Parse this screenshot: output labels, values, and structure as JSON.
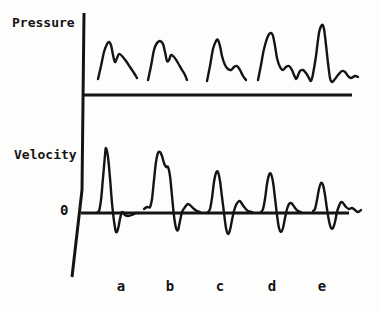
{
  "figure": {
    "background": "#fdfdfb",
    "ink": "#141414",
    "pressure_label": "Pressure",
    "velocity_label": "Velocity",
    "zero_label": "0",
    "beat_labels": [
      "a",
      "b",
      "c",
      "d",
      "e"
    ]
  },
  "chart_data": {
    "type": "line",
    "title": "",
    "xlabel": "",
    "categories": [
      "a",
      "b",
      "c",
      "d",
      "e"
    ],
    "coordinate_space": "figure pixels, y increases downward, canvas 380x311",
    "vertical_axis": {
      "points": [
        [
          84,
          13
        ],
        [
          82,
          190
        ],
        [
          72,
          277
        ]
      ],
      "width": 3
    },
    "panels": [
      {
        "name": "pressure",
        "ylabel": "Pressure",
        "baseline": {
          "y": 95,
          "x1": 82,
          "x2": 352,
          "width": 3
        },
        "series": [
          {
            "name": "a",
            "points": [
              [
                98,
                79
              ],
              [
                101,
                66
              ],
              [
                104,
                52
              ],
              [
                107,
                44
              ],
              [
                109,
                42
              ],
              [
                111,
                45
              ],
              [
                113,
                55
              ],
              [
                115,
                62
              ],
              [
                117,
                58
              ],
              [
                119,
                54
              ],
              [
                122,
                56
              ],
              [
                126,
                61
              ],
              [
                130,
                67
              ],
              [
                134,
                73
              ],
              [
                137,
                78
              ]
            ]
          },
          {
            "name": "b",
            "points": [
              [
                148,
                80
              ],
              [
                151,
                66
              ],
              [
                154,
                50
              ],
              [
                157,
                43
              ],
              [
                160,
                41
              ],
              [
                163,
                44
              ],
              [
                165,
                52
              ],
              [
                167,
                61
              ],
              [
                169,
                60
              ],
              [
                171,
                55
              ],
              [
                174,
                57
              ],
              [
                178,
                63
              ],
              [
                182,
                70
              ],
              [
                185,
                75
              ],
              [
                187,
                80
              ]
            ]
          },
          {
            "name": "c",
            "points": [
              [
                207,
                81
              ],
              [
                210,
                66
              ],
              [
                213,
                49
              ],
              [
                216,
                41
              ],
              [
                218,
                40
              ],
              [
                220,
                46
              ],
              [
                222,
                56
              ],
              [
                225,
                65
              ],
              [
                228,
                69
              ],
              [
                231,
                70
              ],
              [
                234,
                67
              ],
              [
                237,
                66
              ],
              [
                240,
                70
              ],
              [
                243,
                76
              ],
              [
                246,
                80
              ]
            ]
          },
          {
            "name": "d",
            "points": [
              [
                258,
                80
              ],
              [
                261,
                65
              ],
              [
                264,
                49
              ],
              [
                268,
                36
              ],
              [
                271,
                33
              ],
              [
                273,
                36
              ],
              [
                275,
                46
              ],
              [
                277,
                58
              ],
              [
                280,
                67
              ],
              [
                283,
                70
              ],
              [
                286,
                67
              ],
              [
                289,
                66
              ],
              [
                292,
                70
              ],
              [
                294,
                75
              ],
              [
                296,
                79
              ]
            ]
          },
          {
            "name": "e",
            "points": [
              [
                297,
                78
              ],
              [
                300,
                71
              ],
              [
                303,
                70
              ],
              [
                306,
                73
              ],
              [
                309,
                78
              ],
              [
                311,
                81
              ],
              [
                313,
                74
              ],
              [
                316,
                56
              ],
              [
                319,
                33
              ],
              [
                322,
                25
              ],
              [
                324,
                29
              ],
              [
                326,
                45
              ],
              [
                328,
                63
              ],
              [
                330,
                78
              ],
              [
                332,
                82
              ],
              [
                335,
                79
              ],
              [
                338,
                75
              ],
              [
                342,
                71
              ],
              [
                345,
                72
              ],
              [
                348,
                76
              ],
              [
                351,
                78
              ],
              [
                355,
                76
              ],
              [
                358,
                77
              ]
            ]
          }
        ]
      },
      {
        "name": "velocity",
        "ylabel": "Velocity",
        "zero_tick_label": "0",
        "baseline": {
          "y": 213,
          "x1": 81,
          "x2": 349,
          "width": 2.8
        },
        "series": [
          {
            "name": "a",
            "points": [
              [
                96,
                213
              ],
              [
                99,
                211
              ],
              [
                101,
                200
              ],
              [
                103,
                178
              ],
              [
                105,
                155
              ],
              [
                106,
                148
              ],
              [
                108,
                157
              ],
              [
                110,
                178
              ],
              [
                112,
                203
              ],
              [
                114,
                221
              ],
              [
                116,
                232
              ],
              [
                118,
                229
              ],
              [
                120,
                219
              ],
              [
                122,
                212
              ],
              [
                125,
                215
              ],
              [
                128,
                216
              ],
              [
                132,
                215
              ],
              [
                136,
                213
              ],
              [
                139,
                213
              ]
            ]
          },
          {
            "name": "b",
            "points": [
              [
                144,
                209
              ],
              [
                147,
                207
              ],
              [
                150,
                207
              ],
              [
                152,
                199
              ],
              [
                154,
                180
              ],
              [
                156,
                162
              ],
              [
                158,
                153
              ],
              [
                160,
                152
              ],
              [
                162,
                156
              ],
              [
                164,
                163
              ],
              [
                166,
                167
              ],
              [
                168,
                167
              ],
              [
                170,
                176
              ],
              [
                172,
                196
              ],
              [
                174,
                216
              ],
              [
                176,
                228
              ],
              [
                178,
                230
              ],
              [
                180,
                221
              ],
              [
                182,
                212
              ],
              [
                185,
                207
              ],
              [
                188,
                204
              ],
              [
                191,
                206
              ],
              [
                194,
                209
              ],
              [
                197,
                211
              ],
              [
                200,
                212
              ]
            ]
          },
          {
            "name": "c",
            "points": [
              [
                208,
                212
              ],
              [
                210,
                209
              ],
              [
                212,
                198
              ],
              [
                214,
                182
              ],
              [
                216,
                173
              ],
              [
                218,
                172
              ],
              [
                220,
                181
              ],
              [
                222,
                197
              ],
              [
                224,
                213
              ],
              [
                226,
                228
              ],
              [
                228,
                234
              ],
              [
                230,
                230
              ],
              [
                232,
                220
              ],
              [
                234,
                211
              ],
              [
                236,
                205
              ],
              [
                238,
                202
              ],
              [
                240,
                201
              ],
              [
                242,
                204
              ],
              [
                245,
                208
              ],
              [
                248,
                211
              ],
              [
                252,
                212
              ]
            ]
          },
          {
            "name": "d",
            "points": [
              [
                261,
                212
              ],
              [
                263,
                209
              ],
              [
                265,
                199
              ],
              [
                267,
                184
              ],
              [
                269,
                175
              ],
              [
                271,
                174
              ],
              [
                273,
                182
              ],
              [
                275,
                198
              ],
              [
                277,
                215
              ],
              [
                279,
                228
              ],
              [
                281,
                232
              ],
              [
                283,
                228
              ],
              [
                285,
                218
              ],
              [
                287,
                209
              ],
              [
                289,
                204
              ],
              [
                291,
                203
              ],
              [
                293,
                205
              ],
              [
                295,
                208
              ],
              [
                298,
                211
              ],
              [
                301,
                212
              ]
            ]
          },
          {
            "name": "e",
            "points": [
              [
                313,
                211
              ],
              [
                315,
                209
              ],
              [
                317,
                200
              ],
              [
                319,
                189
              ],
              [
                321,
                183
              ],
              [
                323,
                185
              ],
              [
                325,
                195
              ],
              [
                327,
                209
              ],
              [
                329,
                221
              ],
              [
                331,
                228
              ],
              [
                333,
                228
              ],
              [
                335,
                222
              ],
              [
                337,
                212
              ],
              [
                339,
                206
              ],
              [
                341,
                202
              ],
              [
                343,
                203
              ],
              [
                346,
                207
              ],
              [
                349,
                209
              ],
              [
                352,
                208
              ],
              [
                355,
                210
              ],
              [
                358,
                212
              ],
              [
                361,
                210
              ]
            ]
          }
        ]
      }
    ]
  }
}
